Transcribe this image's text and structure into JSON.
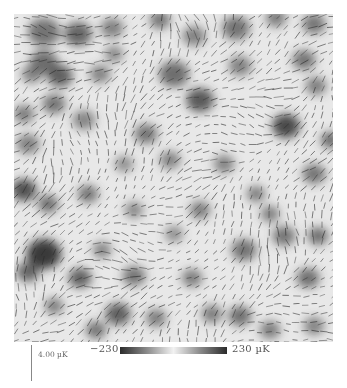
{
  "figure": {
    "map": {
      "background": "#e8e8e8",
      "vector_color": "#2a2a2a",
      "hot_spots": [
        {
          "x": 30,
          "y": 18,
          "r": 14,
          "d": 0.55
        },
        {
          "x": 64,
          "y": 20,
          "r": 12,
          "d": 0.65
        },
        {
          "x": 98,
          "y": 14,
          "r": 10,
          "d": 0.45
        },
        {
          "x": 30,
          "y": 48,
          "r": 12,
          "d": 0.6
        },
        {
          "x": 46,
          "y": 62,
          "r": 11,
          "d": 0.7
        },
        {
          "x": 18,
          "y": 60,
          "r": 9,
          "d": 0.45
        },
        {
          "x": 86,
          "y": 60,
          "r": 9,
          "d": 0.45
        },
        {
          "x": 40,
          "y": 90,
          "r": 10,
          "d": 0.55
        },
        {
          "x": 100,
          "y": 40,
          "r": 8,
          "d": 0.4
        },
        {
          "x": 146,
          "y": 6,
          "r": 9,
          "d": 0.55
        },
        {
          "x": 180,
          "y": 22,
          "r": 10,
          "d": 0.45
        },
        {
          "x": 160,
          "y": 60,
          "r": 13,
          "d": 0.6
        },
        {
          "x": 186,
          "y": 86,
          "r": 12,
          "d": 0.75
        },
        {
          "x": 222,
          "y": 14,
          "r": 12,
          "d": 0.55
        },
        {
          "x": 262,
          "y": 4,
          "r": 9,
          "d": 0.5
        },
        {
          "x": 300,
          "y": 10,
          "r": 10,
          "d": 0.55
        },
        {
          "x": 226,
          "y": 52,
          "r": 10,
          "d": 0.45
        },
        {
          "x": 290,
          "y": 46,
          "r": 10,
          "d": 0.55
        },
        {
          "x": 302,
          "y": 72,
          "r": 9,
          "d": 0.5
        },
        {
          "x": 10,
          "y": 100,
          "r": 9,
          "d": 0.5
        },
        {
          "x": 70,
          "y": 106,
          "r": 10,
          "d": 0.4
        },
        {
          "x": 132,
          "y": 120,
          "r": 10,
          "d": 0.55
        },
        {
          "x": 156,
          "y": 146,
          "r": 9,
          "d": 0.45
        },
        {
          "x": 272,
          "y": 112,
          "r": 12,
          "d": 0.85
        },
        {
          "x": 316,
          "y": 126,
          "r": 8,
          "d": 0.65
        },
        {
          "x": 300,
          "y": 160,
          "r": 10,
          "d": 0.55
        },
        {
          "x": 14,
          "y": 130,
          "r": 10,
          "d": 0.45
        },
        {
          "x": 10,
          "y": 176,
          "r": 11,
          "d": 0.8
        },
        {
          "x": 34,
          "y": 190,
          "r": 9,
          "d": 0.6
        },
        {
          "x": 74,
          "y": 180,
          "r": 9,
          "d": 0.55
        },
        {
          "x": 110,
          "y": 150,
          "r": 8,
          "d": 0.35
        },
        {
          "x": 120,
          "y": 196,
          "r": 8,
          "d": 0.4
        },
        {
          "x": 210,
          "y": 150,
          "r": 9,
          "d": 0.45
        },
        {
          "x": 242,
          "y": 180,
          "r": 8,
          "d": 0.5
        },
        {
          "x": 256,
          "y": 200,
          "r": 8,
          "d": 0.5
        },
        {
          "x": 186,
          "y": 196,
          "r": 9,
          "d": 0.5
        },
        {
          "x": 30,
          "y": 240,
          "r": 15,
          "d": 0.95
        },
        {
          "x": 14,
          "y": 258,
          "r": 10,
          "d": 0.65
        },
        {
          "x": 66,
          "y": 264,
          "r": 10,
          "d": 0.7
        },
        {
          "x": 88,
          "y": 236,
          "r": 8,
          "d": 0.45
        },
        {
          "x": 120,
          "y": 262,
          "r": 10,
          "d": 0.55
        },
        {
          "x": 104,
          "y": 300,
          "r": 11,
          "d": 0.7
        },
        {
          "x": 40,
          "y": 292,
          "r": 8,
          "d": 0.5
        },
        {
          "x": 82,
          "y": 316,
          "r": 9,
          "d": 0.55
        },
        {
          "x": 142,
          "y": 304,
          "r": 9,
          "d": 0.5
        },
        {
          "x": 178,
          "y": 264,
          "r": 9,
          "d": 0.5
        },
        {
          "x": 198,
          "y": 300,
          "r": 9,
          "d": 0.5
        },
        {
          "x": 230,
          "y": 236,
          "r": 11,
          "d": 0.55
        },
        {
          "x": 270,
          "y": 222,
          "r": 10,
          "d": 0.55
        },
        {
          "x": 304,
          "y": 222,
          "r": 9,
          "d": 0.6
        },
        {
          "x": 294,
          "y": 264,
          "r": 10,
          "d": 0.6
        },
        {
          "x": 226,
          "y": 302,
          "r": 10,
          "d": 0.6
        },
        {
          "x": 256,
          "y": 316,
          "r": 9,
          "d": 0.5
        },
        {
          "x": 300,
          "y": 312,
          "r": 9,
          "d": 0.45
        },
        {
          "x": 160,
          "y": 220,
          "r": 8,
          "d": 0.35
        }
      ],
      "grid_step": 9,
      "vector_length_max": 9
    },
    "colorbar": {
      "min_label": "−230",
      "max_label": "230 µK",
      "stops": [
        "#2b2b2b",
        "#8a8a8a",
        "#f2f2f2",
        "#8a8a8a",
        "#2b2b2b"
      ]
    },
    "scale_bar": {
      "label": "4.00 µK"
    }
  }
}
